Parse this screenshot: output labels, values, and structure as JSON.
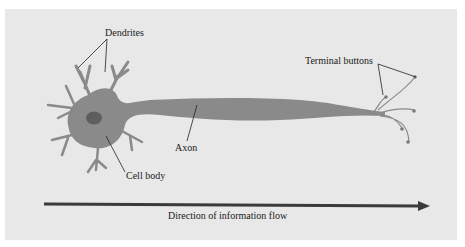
{
  "diagram": {
    "labels": {
      "dendrites": "Dendrites",
      "terminal_buttons": "Terminal buttons",
      "axon": "Axon",
      "cell_body": "Cell body",
      "flow": "Direction of information flow"
    },
    "colors": {
      "background": "#e8e8e8",
      "neuron": "#8a8a8a",
      "nucleus": "#5e5e5e",
      "arrow": "#3a3a3a",
      "leader_lines": "#222222"
    }
  }
}
